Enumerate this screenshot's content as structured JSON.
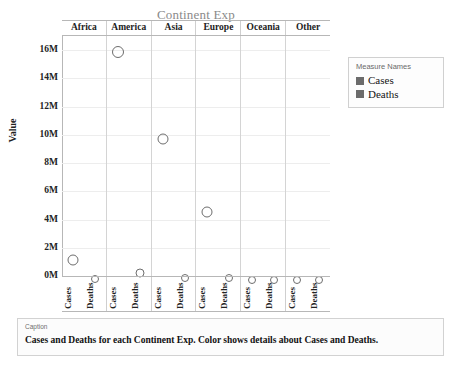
{
  "title": "Continent Exp",
  "legend": {
    "title": "Measure Names",
    "entries": [
      {
        "label": "Cases",
        "color": "#6b6b6b"
      },
      {
        "label": "Deaths",
        "color": "#6b6b6b"
      }
    ]
  },
  "caption": {
    "kicker": "Caption",
    "text": "Cases and Deaths for each Continent Exp.  Color shows details about Cases and Deaths."
  },
  "axis": {
    "y_title": "Value",
    "y_ticks": [
      "0M",
      "2M",
      "4M",
      "6M",
      "8M",
      "10M",
      "12M",
      "14M",
      "16M"
    ]
  },
  "chart_data": {
    "type": "scatter",
    "title": "Continent Exp",
    "xlabel": "",
    "ylabel": "Value",
    "ylim": [
      0,
      17000000
    ],
    "ytick_values": [
      0,
      2000000,
      4000000,
      6000000,
      8000000,
      10000000,
      12000000,
      14000000,
      16000000
    ],
    "ytick_labels": [
      "0M",
      "2M",
      "4M",
      "6M",
      "8M",
      "10M",
      "12M",
      "14M",
      "16M"
    ],
    "grid": true,
    "legend_position": "right",
    "legend_title": "Measure Names",
    "panel_field": "Continent Exp",
    "categories": [
      "Africa",
      "America",
      "Asia",
      "Europe",
      "Oceania",
      "Other"
    ],
    "measures": [
      "Cases",
      "Deaths"
    ],
    "series": [
      {
        "name": "Cases",
        "color": "#6b6b6b",
        "values": [
          1500000,
          16300000,
          10100000,
          4900000,
          30000,
          10000
        ]
      },
      {
        "name": "Deaths",
        "color": "#6b6b6b",
        "values": [
          40000,
          550000,
          150000,
          160000,
          1000,
          500
        ]
      }
    ],
    "points": [
      {
        "panel": "Africa",
        "measure": "Cases",
        "value": 1500000,
        "size": 11
      },
      {
        "panel": "Africa",
        "measure": "Deaths",
        "value": 40000,
        "size": 8
      },
      {
        "panel": "America",
        "measure": "Cases",
        "value": 16300000,
        "size": 12
      },
      {
        "panel": "America",
        "measure": "Deaths",
        "value": 550000,
        "size": 9
      },
      {
        "panel": "Asia",
        "measure": "Cases",
        "value": 10100000,
        "size": 11
      },
      {
        "panel": "Asia",
        "measure": "Deaths",
        "value": 150000,
        "size": 8
      },
      {
        "panel": "Europe",
        "measure": "Cases",
        "value": 4900000,
        "size": 11
      },
      {
        "panel": "Europe",
        "measure": "Deaths",
        "value": 160000,
        "size": 8
      },
      {
        "panel": "Oceania",
        "measure": "Cases",
        "value": 30000,
        "size": 8
      },
      {
        "panel": "Oceania",
        "measure": "Deaths",
        "value": 1000,
        "size": 8
      },
      {
        "panel": "Other",
        "measure": "Cases",
        "value": 10000,
        "size": 8
      },
      {
        "panel": "Other",
        "measure": "Deaths",
        "value": 500,
        "size": 8
      }
    ]
  }
}
